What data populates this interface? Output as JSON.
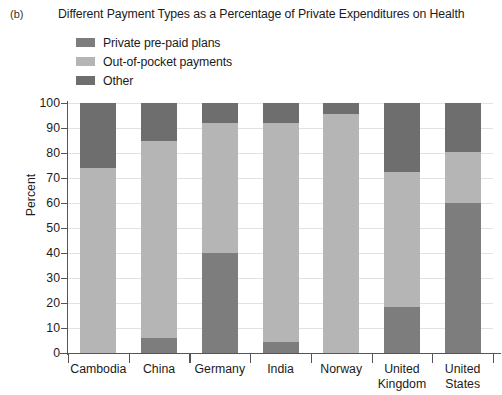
{
  "panel": {
    "label": "(b)"
  },
  "chart_data": {
    "type": "bar",
    "subtype": "stacked-bar-100",
    "title": "Different Payment Types as a Percentage of Private Expenditures on Health",
    "xlabel": "",
    "ylabel": "Percent",
    "ylim": [
      0,
      100
    ],
    "ytick_interval": 10,
    "yticks": [
      0,
      10,
      20,
      30,
      40,
      50,
      60,
      70,
      80,
      90,
      100
    ],
    "grid": true,
    "legend_position": "top-left",
    "categories": [
      "Cambodia",
      "China",
      "Germany",
      "India",
      "Norway",
      "United Kingdom",
      "United States"
    ],
    "series": [
      {
        "name": "Private pre-paid plans",
        "color": "#7d7d7d",
        "values": [
          0,
          6,
          40,
          4.5,
          0,
          18.5,
          60
        ]
      },
      {
        "name": "Out-of-pocket payments",
        "color": "#b5b5b5",
        "values": [
          74,
          79,
          52,
          87.5,
          95.5,
          54,
          20.5
        ]
      },
      {
        "name": "Other",
        "color": "#6e6e6e",
        "values": [
          26,
          15,
          8,
          8,
          4.5,
          27.5,
          19.5
        ]
      }
    ]
  },
  "colors": {
    "axis": "#555555",
    "grid": "#e2e2e2",
    "text": "#1b1b1b",
    "background": "#ffffff"
  }
}
